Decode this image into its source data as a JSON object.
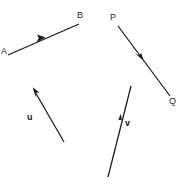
{
  "figure": {
    "width": 186,
    "height": 184,
    "background_color": "#ffffff",
    "stroke_color": "#1a1a1a",
    "label_color": "#2b2b2b"
  },
  "vectors": [
    {
      "id": "ab",
      "name": "vector-ab",
      "kind": "named-endpoints",
      "tail_label": "A",
      "head_label": "B",
      "tail": {
        "x": 8,
        "y": 55
      },
      "head": {
        "x": 79,
        "y": 24
      },
      "arrowhead_at": {
        "x": 42,
        "y": 39
      },
      "direction": "up-right",
      "tail_label_pos": {
        "x": 1,
        "y": 47
      },
      "head_label_pos": {
        "x": 77,
        "y": 11
      }
    },
    {
      "id": "pq",
      "name": "vector-pq",
      "kind": "named-endpoints",
      "tail_label": "P",
      "head_label": "Q",
      "tail": {
        "x": 118,
        "y": 26
      },
      "head": {
        "x": 170,
        "y": 96
      },
      "arrowhead_at": {
        "x": 140,
        "y": 56
      },
      "direction": "down-right",
      "tail_label_pos": {
        "x": 110,
        "y": 13
      },
      "head_label_pos": {
        "x": 169,
        "y": 97
      }
    },
    {
      "id": "u",
      "name": "vector-u",
      "kind": "bold-letter",
      "label": "u",
      "tail": {
        "x": 64,
        "y": 142
      },
      "head": {
        "x": 33,
        "y": 88
      },
      "arrowhead_at": {
        "x": 35,
        "y": 92
      },
      "direction": "up-left",
      "label_pos": {
        "x": 27,
        "y": 113
      }
    },
    {
      "id": "v",
      "name": "vector-v",
      "kind": "bold-letter",
      "label": "v",
      "tail": {
        "x": 108,
        "y": 177
      },
      "head": {
        "x": 131,
        "y": 86
      },
      "arrowhead_at": {
        "x": 119,
        "y": 121
      },
      "direction": "up-right",
      "label_pos": {
        "x": 125,
        "y": 119
      }
    }
  ]
}
